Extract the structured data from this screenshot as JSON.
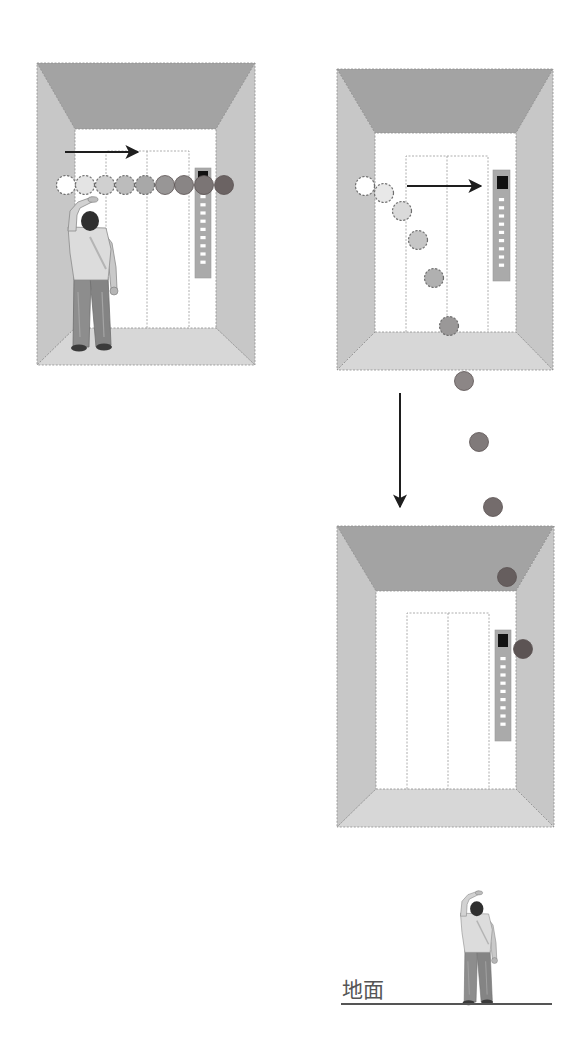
{
  "figure": {
    "title": "",
    "ground": {
      "label": "地面",
      "label_pos": {
        "x": 342,
        "y": 997
      },
      "line": {
        "x1": 341,
        "x2": 552,
        "y": 1004
      }
    },
    "colors": {
      "ceiling": "#a3a3a3",
      "side_wall": "#c7c7c7",
      "floor": "#d7d7d7",
      "back_wall": "#ffffff",
      "outline": "#8e8e8e",
      "door_line": "#9a9a9a",
      "button_panel": "#aaaaaa",
      "button_panel_edge": "#999999",
      "display": "#111111",
      "floor_button": "#ffffff",
      "arrow": "#1e1e1e",
      "ground_line": "#555555",
      "ground_text": "#555555",
      "ball_dash": "#6e6e6e"
    },
    "elevators": [
      {
        "id": "elevator-left-horizontal-throw",
        "outer": [
          37,
          63,
          255,
          365
        ],
        "inner": [
          75,
          129,
          216,
          328
        ],
        "doors": {
          "x1": 106,
          "mid": 147,
          "x2": 189,
          "top": 151
        },
        "button_panel": {
          "x": 195,
          "y": 168,
          "w": 16,
          "h": 110,
          "display": [
            198,
            171,
            10,
            10
          ],
          "buttons_start": 195,
          "button_count": 9,
          "button_gap": 8.2
        }
      },
      {
        "id": "elevator-right-top",
        "outer": [
          337,
          69,
          553,
          370
        ],
        "inner": [
          375,
          133,
          516,
          332
        ],
        "doors": {
          "x1": 406,
          "mid": 447,
          "x2": 488,
          "top": 156
        },
        "button_panel": {
          "x": 493,
          "y": 170,
          "w": 17,
          "h": 111,
          "display": [
            497,
            176,
            11,
            13
          ],
          "buttons_start": 198,
          "button_count": 9,
          "button_gap": 8.2
        }
      },
      {
        "id": "elevator-right-bottom",
        "outer": [
          337,
          526,
          554,
          827
        ],
        "inner": [
          376,
          591,
          516,
          789
        ],
        "doors": {
          "x1": 407,
          "mid": 448,
          "x2": 489,
          "top": 613
        },
        "button_panel": {
          "x": 495,
          "y": 630,
          "w": 16,
          "h": 111,
          "display": [
            498,
            634,
            10,
            13
          ],
          "buttons_start": 657,
          "button_count": 9,
          "button_gap": 8.2
        }
      }
    ],
    "people": [
      {
        "id": "person-in-elevator",
        "x": 66,
        "y": 197,
        "scale": 1
      },
      {
        "id": "person-on-ground",
        "x": 459,
        "y": 891,
        "scale": 0.74
      }
    ],
    "arrows": [
      {
        "id": "arrow-horizontal-left-panel",
        "x1": 65,
        "y1": 152,
        "x2": 138,
        "y2": 152
      },
      {
        "id": "arrow-horizontal-right-panel",
        "x1": 407,
        "y1": 186,
        "x2": 481,
        "y2": 186
      },
      {
        "id": "arrow-down-elevator-motion",
        "x1": 400,
        "y1": 393,
        "x2": 400,
        "y2": 507
      }
    ],
    "ball_radius": 9.5,
    "balls_left_panel": [
      {
        "x": 66,
        "y": 185,
        "fill": "#ffffff",
        "dashed": true
      },
      {
        "x": 85,
        "y": 185,
        "fill": "#e4e4e4",
        "dashed": true
      },
      {
        "x": 105,
        "y": 185,
        "fill": "#d0d0d0",
        "dashed": true
      },
      {
        "x": 125,
        "y": 185,
        "fill": "#bcbcbc",
        "dashed": true
      },
      {
        "x": 145,
        "y": 185,
        "fill": "#a8a8a8",
        "dashed": true
      },
      {
        "x": 165,
        "y": 185,
        "fill": "#989696",
        "dashed": false
      },
      {
        "x": 184,
        "y": 185,
        "fill": "#898585",
        "dashed": false
      },
      {
        "x": 204,
        "y": 185,
        "fill": "#7b7575",
        "dashed": false
      },
      {
        "x": 224,
        "y": 185,
        "fill": "#6b6363",
        "dashed": false
      }
    ],
    "balls_right_trajectory": [
      {
        "x": 365,
        "y": 186,
        "fill": "#ffffff",
        "dashed": true
      },
      {
        "x": 384,
        "y": 193,
        "fill": "#e8e8e8",
        "dashed": true
      },
      {
        "x": 402,
        "y": 211,
        "fill": "#dadada",
        "dashed": true
      },
      {
        "x": 418,
        "y": 240,
        "fill": "#c6c6c6",
        "dashed": true
      },
      {
        "x": 434,
        "y": 278,
        "fill": "#b0b0b0",
        "dashed": true
      },
      {
        "x": 449,
        "y": 326,
        "fill": "#9a9898",
        "dashed": true
      },
      {
        "x": 464,
        "y": 381,
        "fill": "#8c8686",
        "dashed": false
      },
      {
        "x": 479,
        "y": 442,
        "fill": "#807a7a",
        "dashed": false
      },
      {
        "x": 493,
        "y": 507,
        "fill": "#746c6c",
        "dashed": false
      },
      {
        "x": 507,
        "y": 577,
        "fill": "#665e5e",
        "dashed": false
      },
      {
        "x": 523,
        "y": 649,
        "fill": "#5c5454",
        "dashed": false
      }
    ]
  }
}
